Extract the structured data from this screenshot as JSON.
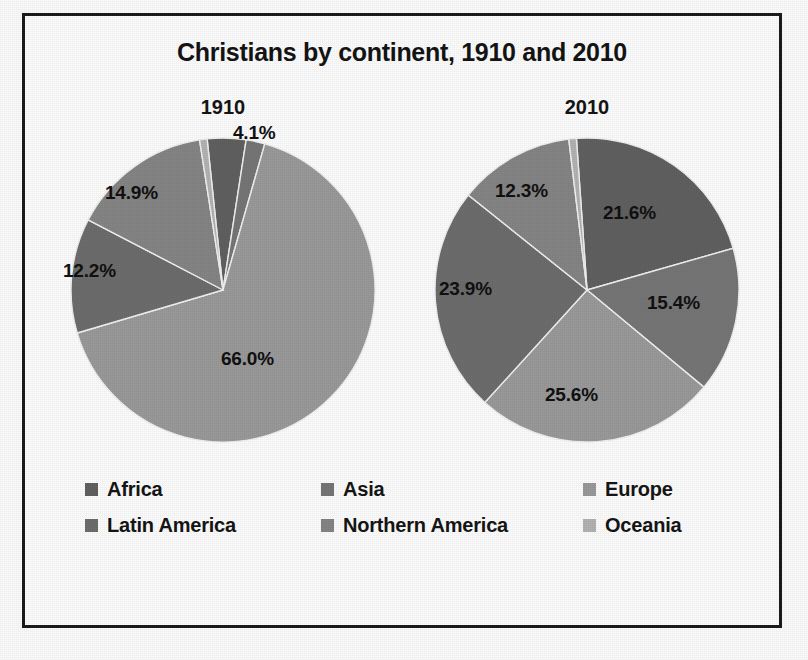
{
  "chart_data": {
    "type": "pie",
    "title": "Christians by continent, 1910 and 2010",
    "xlabel": "",
    "ylabel": "",
    "legend_position": "bottom",
    "grid": false,
    "categories": [
      "Africa",
      "Asia",
      "Europe",
      "Latin America",
      "Northern America",
      "Oceania"
    ],
    "colors": {
      "Africa": "#616161",
      "Asia": "#777777",
      "Europe": "#9b9b9b",
      "Latin America": "#6e6e6e",
      "Northern America": "#868686",
      "Oceania": "#b4b4b4"
    },
    "charts": [
      {
        "name": "1910",
        "label": "1910",
        "slices": [
          {
            "category": "Africa",
            "value": 4.1,
            "label": "4.1%",
            "show_label": true
          },
          {
            "category": "Asia",
            "value": 2.0,
            "label": "2.0%",
            "show_label": false
          },
          {
            "category": "Europe",
            "value": 66.0,
            "label": "66.0%",
            "show_label": true
          },
          {
            "category": "Latin America",
            "value": 12.2,
            "label": "12.2%",
            "show_label": true
          },
          {
            "category": "Northern America",
            "value": 14.9,
            "label": "14.9%",
            "show_label": true
          },
          {
            "category": "Oceania",
            "value": 0.8,
            "label": "0.8%",
            "show_label": false
          }
        ]
      },
      {
        "name": "2010",
        "label": "2010",
        "slices": [
          {
            "category": "Africa",
            "value": 21.6,
            "label": "21.6%",
            "show_label": true
          },
          {
            "category": "Asia",
            "value": 15.4,
            "label": "15.4%",
            "show_label": true
          },
          {
            "category": "Europe",
            "value": 25.6,
            "label": "25.6%",
            "show_label": true
          },
          {
            "category": "Latin America",
            "value": 23.9,
            "label": "23.9%",
            "show_label": true
          },
          {
            "category": "Northern America",
            "value": 12.3,
            "label": "12.3%",
            "show_label": true
          },
          {
            "category": "Oceania",
            "value": 0.8,
            "label": "0.8%",
            "show_label": false
          }
        ]
      }
    ]
  },
  "title": "Christians by continent, 1910 and 2010",
  "pies": [
    {
      "caption": "1910",
      "labels": [
        {
          "text": "4.1%",
          "x": 180,
          "y": -8
        },
        {
          "text": "14.9%",
          "x": 52,
          "y": 52
        },
        {
          "text": "12.2%",
          "x": 10,
          "y": 130
        },
        {
          "text": "66.0%",
          "x": 168,
          "y": 218
        }
      ]
    },
    {
      "caption": "2010",
      "labels": [
        {
          "text": "12.3%",
          "x": 78,
          "y": 50
        },
        {
          "text": "21.6%",
          "x": 186,
          "y": 72
        },
        {
          "text": "15.4%",
          "x": 230,
          "y": 162
        },
        {
          "text": "23.9%",
          "x": 22,
          "y": 148
        },
        {
          "text": "25.6%",
          "x": 128,
          "y": 254
        }
      ]
    }
  ],
  "legend": {
    "items": [
      {
        "label": "Africa",
        "color": "#616161"
      },
      {
        "label": "Asia",
        "color": "#777777"
      },
      {
        "label": "Europe",
        "color": "#9b9b9b"
      },
      {
        "label": "Latin America",
        "color": "#6e6e6e"
      },
      {
        "label": "Northern America",
        "color": "#868686"
      },
      {
        "label": "Oceania",
        "color": "#b4b4b4"
      }
    ]
  }
}
